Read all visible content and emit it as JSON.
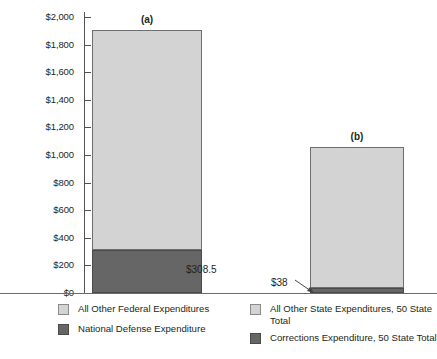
{
  "chart_data": {
    "type": "bar",
    "subtype": "stacked",
    "title": "",
    "xlabel": "",
    "ylabel": "Billions",
    "ylim": [
      0,
      2000
    ],
    "ytick_labels": [
      "$2,000",
      "$1,800",
      "$1,600",
      "$1,400",
      "$1,200",
      "$1,000",
      "$800",
      "$600",
      "$400",
      "$200",
      "$0"
    ],
    "ytick_values": [
      2000,
      1800,
      1600,
      1400,
      1200,
      1000,
      800,
      600,
      400,
      200,
      0
    ],
    "grid": false,
    "legend_position": "bottom",
    "categories": [
      "(a)",
      "(b)"
    ],
    "series": [
      {
        "name": "All Other Expenditures",
        "swatch": "light",
        "values": [
          1597.5,
          1020
        ]
      },
      {
        "name": "Defense / Corrections Expenditure",
        "swatch": "dark",
        "values": [
          308.5,
          38
        ]
      }
    ],
    "totals": [
      1906,
      1058
    ],
    "annotations": [
      {
        "text": "$308.5",
        "series": "National Defense Expenditure",
        "category": "(a)",
        "value": 308.5
      },
      {
        "text": "$38",
        "series": "Corrections Expenditure, 50 State Total",
        "category": "(b)",
        "value": 38
      }
    ]
  },
  "axis": {
    "ylabel": "Billions",
    "ticks": [
      {
        "label": "$2,000"
      },
      {
        "label": "$1,800"
      },
      {
        "label": "$1,600"
      },
      {
        "label": "$1,400"
      },
      {
        "label": "$1,200"
      },
      {
        "label": "$1,000"
      },
      {
        "label": "$800"
      },
      {
        "label": "$600"
      },
      {
        "label": "$400"
      },
      {
        "label": "$200"
      },
      {
        "label": "$0"
      }
    ]
  },
  "bars": [
    {
      "tag": "(a)",
      "value_label": "$308.5"
    },
    {
      "tag": "(b)",
      "value_label": "$38"
    }
  ],
  "legend": {
    "left": [
      {
        "label": "All Other Federal Expenditures",
        "swatch": "light"
      },
      {
        "label": "National Defense Expenditure",
        "swatch": "dark"
      }
    ],
    "right": [
      {
        "label": "All Other State Expenditures, 50 State Total",
        "swatch": "light"
      },
      {
        "label": "Corrections Expenditure, 50 State Total",
        "swatch": "dark"
      }
    ]
  },
  "colors": {
    "light_segment": "#d3d3d3",
    "dark_segment": "#666666",
    "axis": "#555555",
    "text": "#231f20"
  }
}
